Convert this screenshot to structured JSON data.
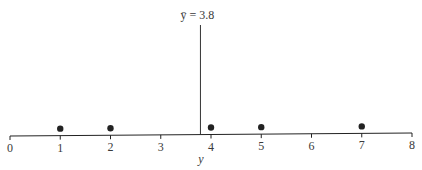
{
  "chart_data": {
    "type": "scatter",
    "title": "",
    "xlabel": "y",
    "ylabel": "",
    "xlim": [
      0,
      8
    ],
    "x_ticks": [
      0,
      1,
      2,
      3,
      4,
      5,
      6,
      7,
      8
    ],
    "tick_labels": [
      "0",
      "1",
      "2",
      "3",
      "4",
      "5",
      "6",
      "7",
      "8"
    ],
    "points": [
      1,
      2,
      4,
      5,
      7
    ],
    "grid": false,
    "legend": null,
    "annotations": [
      {
        "type": "vline",
        "x": 3.8,
        "label": "ȳ = 3.8"
      }
    ],
    "colors": {
      "ink": "#222222",
      "text": "#3a3a3a"
    }
  },
  "labels": {
    "mean_label": "ȳ = 3.8",
    "axis_title": "y"
  }
}
